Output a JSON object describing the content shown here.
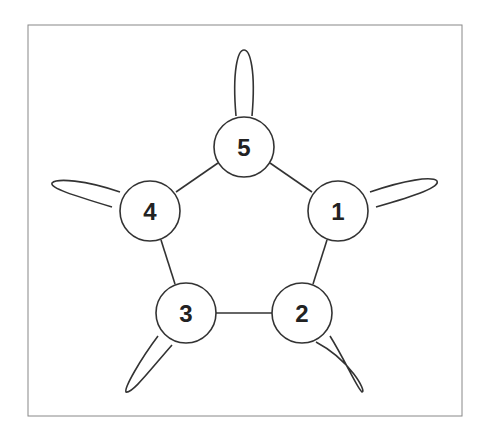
{
  "diagram": {
    "type": "graph",
    "frame": {
      "x": 28,
      "y": 25,
      "width": 434,
      "height": 391
    },
    "nodes": [
      {
        "id": "1",
        "label": "1",
        "cx": 338,
        "cy": 211
      },
      {
        "id": "2",
        "label": "2",
        "cx": 302,
        "cy": 313
      },
      {
        "id": "3",
        "label": "3",
        "cx": 186,
        "cy": 313
      },
      {
        "id": "4",
        "label": "4",
        "cx": 150,
        "cy": 211
      },
      {
        "id": "5",
        "label": "5",
        "cx": 244,
        "cy": 147
      }
    ],
    "node_radius": 30,
    "edges": [
      {
        "from": "1",
        "to": "2"
      },
      {
        "from": "2",
        "to": "3"
      },
      {
        "from": "3",
        "to": "4"
      },
      {
        "from": "4",
        "to": "5"
      },
      {
        "from": "5",
        "to": "1"
      }
    ],
    "self_loops": [
      "1",
      "2",
      "3",
      "4",
      "5"
    ],
    "colors": {
      "stroke": "#333333",
      "frame": "#888888",
      "background": "#ffffff"
    }
  }
}
